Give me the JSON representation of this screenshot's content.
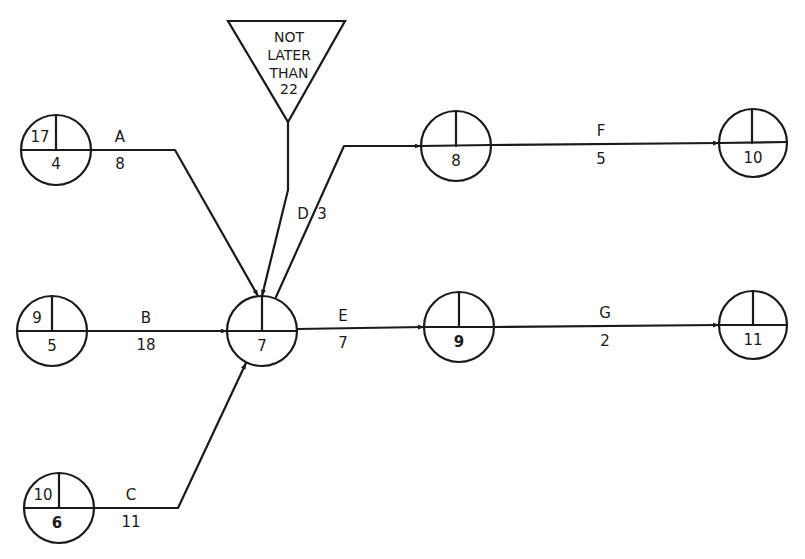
{
  "diagram": {
    "type": "arrow-diagram-network",
    "nodes": [
      {
        "id": "n4",
        "number": "4",
        "top_left": "17",
        "top_right": "",
        "cx": 56,
        "cy": 150,
        "r": 35
      },
      {
        "id": "n5",
        "number": "5",
        "top_left": "9",
        "top_right": "",
        "cx": 52,
        "cy": 331,
        "r": 35
      },
      {
        "id": "n6",
        "number": "6",
        "top_left": "10",
        "top_right": "",
        "cx": 59,
        "cy": 508,
        "r": 35
      },
      {
        "id": "n7",
        "number": "7",
        "top_left": "",
        "top_right": "",
        "cx": 262,
        "cy": 331,
        "r": 35
      },
      {
        "id": "n8",
        "number": "8",
        "top_left": "",
        "top_right": "",
        "cx": 456,
        "cy": 146,
        "r": 35
      },
      {
        "id": "n9",
        "number": "9",
        "top_left": "",
        "top_right": "",
        "cx": 459,
        "cy": 327,
        "r": 35
      },
      {
        "id": "n10",
        "number": "10",
        "top_left": "",
        "top_right": "",
        "cx": 753,
        "cy": 143,
        "r": 34
      },
      {
        "id": "n11",
        "number": "11",
        "top_left": "",
        "top_right": "",
        "cx": 753,
        "cy": 325,
        "r": 34
      }
    ],
    "activities": [
      {
        "id": "A",
        "label": "A",
        "duration": "8",
        "from": "4",
        "to": "7"
      },
      {
        "id": "B",
        "label": "B",
        "duration": "18",
        "from": "5",
        "to": "7"
      },
      {
        "id": "C",
        "label": "C",
        "duration": "11",
        "from": "6",
        "to": "7"
      },
      {
        "id": "D",
        "label": "D",
        "duration": "3",
        "from": "7",
        "to": "8"
      },
      {
        "id": "E",
        "label": "E",
        "duration": "7",
        "from": "7",
        "to": "9"
      },
      {
        "id": "F",
        "label": "F",
        "duration": "5",
        "from": "8",
        "to": "10"
      },
      {
        "id": "G",
        "label": "G",
        "duration": "2",
        "from": "9",
        "to": "11"
      }
    ],
    "constraint": {
      "line1": "NOT",
      "line2": "LATER",
      "line3": "THAN",
      "line4": "22",
      "applies_to_node": "7"
    },
    "colors": {
      "ink": "#1a1a1a",
      "background": "#ffffff"
    }
  }
}
